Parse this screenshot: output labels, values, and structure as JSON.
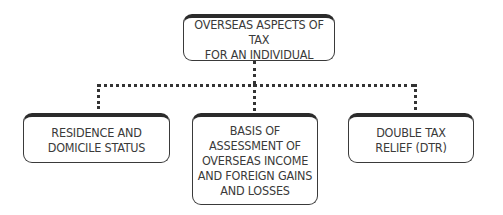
{
  "diagram": {
    "root": {
      "label": "OVERSEAS ASPECTS OF TAX\nFOR AN INDIVIDUAL"
    },
    "children": [
      {
        "label": "RESIDENCE AND\nDOMICILE STATUS"
      },
      {
        "label": "BASIS OF\nASSESSMENT OF\nOVERSEAS INCOME\nAND FOREIGN GAINS\nAND LOSSES"
      },
      {
        "label": "DOUBLE TAX\nRELIEF  (DTR)"
      }
    ],
    "connector_style": "dotted",
    "border_color": "#2b2b2b",
    "text_color": "#3a3a3a"
  }
}
